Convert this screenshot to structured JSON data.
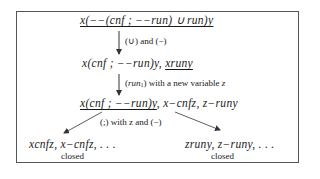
{
  "diagram": {
    "nodes": {
      "root": {
        "text": "x(−−(cnf ; −−run) ∪ run)y",
        "underlined": true
      },
      "step1": {
        "prefix": "x(cnf ; −−run)y, ",
        "underlined_part": "xruny"
      },
      "step2": {
        "underlined_part": "x(cnf ; −−run)y",
        "suffix": ", x−cnfz, z−runy"
      },
      "left_leaf": {
        "text": "xcnfz, x−cnfz, . . .",
        "status": "closed"
      },
      "right_leaf": {
        "text": "zruny, z−runy, . . .",
        "status": "closed"
      }
    },
    "edges": {
      "root_to_step1": "(∪) and (−)",
      "step1_to_step2": {
        "rule": "run",
        "rule_sub": "1",
        "text": " with a new variable ",
        "var": "z"
      },
      "step2_to_leaves": "(;) with z and (−)"
    },
    "colors": {
      "line": "#333333",
      "frame": "#555555",
      "text": "#1a1a1a"
    }
  }
}
